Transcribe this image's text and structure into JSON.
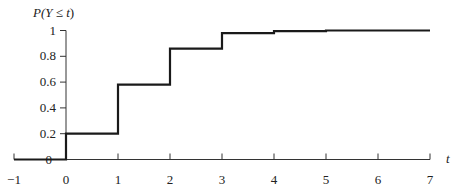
{
  "chart_data": {
    "type": "line",
    "subtype": "step-cdf",
    "title": "",
    "ylabel": "P(Y ≤ t)",
    "xlabel": "t",
    "xlim": [
      -1,
      7
    ],
    "ylim": [
      0,
      1
    ],
    "x_ticks": [
      "−1",
      "0",
      "1",
      "2",
      "3",
      "4",
      "5",
      "6",
      "7"
    ],
    "y_ticks": [
      "0",
      "0.2",
      "0.4",
      "0.6",
      "0.8",
      "1"
    ],
    "grid": false,
    "legend": null,
    "series": [
      {
        "name": "CDF",
        "steps": [
          {
            "t_from": -1,
            "t_to": 0,
            "value": 0.0
          },
          {
            "t_from": 0,
            "t_to": 1,
            "value": 0.2
          },
          {
            "t_from": 1,
            "t_to": 2,
            "value": 0.58
          },
          {
            "t_from": 2,
            "t_to": 3,
            "value": 0.86
          },
          {
            "t_from": 3,
            "t_to": 4,
            "value": 0.98
          },
          {
            "t_from": 4,
            "t_to": 5,
            "value": 0.995
          },
          {
            "t_from": 5,
            "t_to": 7,
            "value": 1.0
          }
        ]
      }
    ]
  },
  "axis": {
    "y_title_parts": {
      "p": "P(",
      "y": "Y",
      "le": " ≤ ",
      "t": "t",
      "close": ")"
    },
    "x_title": "t"
  },
  "style": {
    "line_color": "#1a1a1a",
    "axis_color": "#333333"
  }
}
